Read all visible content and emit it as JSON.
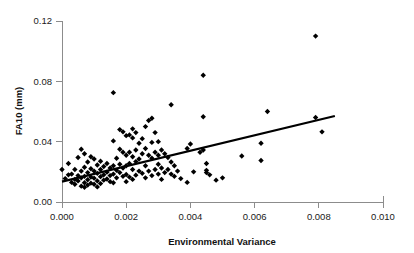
{
  "chart_data": {
    "type": "scatter",
    "title": "",
    "xlabel": "Environmental Variance",
    "ylabel": "FA10 (mm)",
    "xlim": [
      0.0,
      0.01
    ],
    "ylim": [
      0.0,
      0.12
    ],
    "xticks": [
      0.0,
      0.002,
      0.004,
      0.006,
      0.008,
      0.01
    ],
    "xtick_labels": [
      "0.000",
      "0.002",
      "0.004",
      "0.006",
      "0.008",
      "0.010"
    ],
    "yticks": [
      0.0,
      0.04,
      0.08,
      0.12
    ],
    "ytick_labels": [
      "0.00",
      "0.04",
      "0.08",
      "0.12"
    ],
    "grid": false,
    "legend": null,
    "marker": "diamond",
    "marker_color": "#000000",
    "points": [
      [
        0.0,
        0.0215
      ],
      [
        0.0001,
        0.0155
      ],
      [
        0.0002,
        0.0255
      ],
      [
        0.0002,
        0.018
      ],
      [
        0.0003,
        0.013
      ],
      [
        0.0003,
        0.0185
      ],
      [
        0.0004,
        0.0215
      ],
      [
        0.0004,
        0.015
      ],
      [
        0.0004,
        0.0118
      ],
      [
        0.0005,
        0.0295
      ],
      [
        0.0005,
        0.0175
      ],
      [
        0.0005,
        0.014
      ],
      [
        0.0006,
        0.035
      ],
      [
        0.0006,
        0.0205
      ],
      [
        0.0006,
        0.016
      ],
      [
        0.0006,
        0.0105
      ],
      [
        0.0007,
        0.032
      ],
      [
        0.0007,
        0.023
      ],
      [
        0.0007,
        0.017
      ],
      [
        0.0007,
        0.0128
      ],
      [
        0.0007,
        0.0098
      ],
      [
        0.0008,
        0.0265
      ],
      [
        0.0008,
        0.0195
      ],
      [
        0.0008,
        0.0148
      ],
      [
        0.0008,
        0.0112
      ],
      [
        0.0009,
        0.03
      ],
      [
        0.0009,
        0.022
      ],
      [
        0.0009,
        0.0165
      ],
      [
        0.0009,
        0.0125
      ],
      [
        0.001,
        0.0285
      ],
      [
        0.001,
        0.0205
      ],
      [
        0.001,
        0.0158
      ],
      [
        0.001,
        0.0118
      ],
      [
        0.0011,
        0.0245
      ],
      [
        0.0011,
        0.019
      ],
      [
        0.0011,
        0.014
      ],
      [
        0.0011,
        0.01
      ],
      [
        0.0012,
        0.027
      ],
      [
        0.0012,
        0.0215
      ],
      [
        0.0012,
        0.0168
      ],
      [
        0.0012,
        0.0122
      ],
      [
        0.0013,
        0.0235
      ],
      [
        0.0013,
        0.018
      ],
      [
        0.0013,
        0.0145
      ],
      [
        0.0014,
        0.0255
      ],
      [
        0.0014,
        0.0198
      ],
      [
        0.0014,
        0.0152
      ],
      [
        0.0015,
        0.0225
      ],
      [
        0.0015,
        0.0175
      ],
      [
        0.0015,
        0.0135
      ],
      [
        0.0016,
        0.0725
      ],
      [
        0.0016,
        0.0405
      ],
      [
        0.0016,
        0.024
      ],
      [
        0.0016,
        0.0185
      ],
      [
        0.0016,
        0.0128
      ],
      [
        0.0017,
        0.029
      ],
      [
        0.0017,
        0.021
      ],
      [
        0.0017,
        0.016
      ],
      [
        0.0018,
        0.048
      ],
      [
        0.0018,
        0.035
      ],
      [
        0.0018,
        0.025
      ],
      [
        0.0018,
        0.0195
      ],
      [
        0.0019,
        0.0465
      ],
      [
        0.0019,
        0.033
      ],
      [
        0.0019,
        0.0225
      ],
      [
        0.0019,
        0.017
      ],
      [
        0.002,
        0.044
      ],
      [
        0.002,
        0.031
      ],
      [
        0.002,
        0.024
      ],
      [
        0.002,
        0.0182
      ],
      [
        0.002,
        0.0135
      ],
      [
        0.0021,
        0.0445
      ],
      [
        0.0021,
        0.033
      ],
      [
        0.0021,
        0.0255
      ],
      [
        0.0021,
        0.0165
      ],
      [
        0.0022,
        0.0485
      ],
      [
        0.0022,
        0.0425
      ],
      [
        0.0022,
        0.03
      ],
      [
        0.0022,
        0.0215
      ],
      [
        0.0022,
        0.015
      ],
      [
        0.0023,
        0.046
      ],
      [
        0.0023,
        0.0345
      ],
      [
        0.0023,
        0.0268
      ],
      [
        0.0023,
        0.0178
      ],
      [
        0.0024,
        0.039
      ],
      [
        0.0024,
        0.0285
      ],
      [
        0.0024,
        0.0205
      ],
      [
        0.0025,
        0.042
      ],
      [
        0.0025,
        0.032
      ],
      [
        0.0025,
        0.019
      ],
      [
        0.0026,
        0.05
      ],
      [
        0.0026,
        0.0355
      ],
      [
        0.0026,
        0.024
      ],
      [
        0.0026,
        0.016
      ],
      [
        0.0027,
        0.054
      ],
      [
        0.0027,
        0.031
      ],
      [
        0.0027,
        0.0205
      ],
      [
        0.0028,
        0.0555
      ],
      [
        0.0028,
        0.0395
      ],
      [
        0.0028,
        0.029
      ],
      [
        0.0028,
        0.0175
      ],
      [
        0.0029,
        0.046
      ],
      [
        0.0029,
        0.033
      ],
      [
        0.0029,
        0.0215
      ],
      [
        0.003,
        0.04
      ],
      [
        0.003,
        0.031
      ],
      [
        0.003,
        0.025
      ],
      [
        0.003,
        0.0185
      ],
      [
        0.0031,
        0.0345
      ],
      [
        0.0031,
        0.0225
      ],
      [
        0.0031,
        0.015
      ],
      [
        0.0032,
        0.032
      ],
      [
        0.0032,
        0.0195
      ],
      [
        0.0033,
        0.0295
      ],
      [
        0.0033,
        0.0215
      ],
      [
        0.0034,
        0.0645
      ],
      [
        0.0034,
        0.0265
      ],
      [
        0.0034,
        0.0185
      ],
      [
        0.0035,
        0.024
      ],
      [
        0.0035,
        0.017
      ],
      [
        0.0036,
        0.0205
      ],
      [
        0.0037,
        0.0155
      ],
      [
        0.0039,
        0.0355
      ],
      [
        0.0039,
        0.013
      ],
      [
        0.004,
        0.0385
      ],
      [
        0.0041,
        0.02
      ],
      [
        0.0043,
        0.033
      ],
      [
        0.0044,
        0.084
      ],
      [
        0.0044,
        0.0565
      ],
      [
        0.0044,
        0.0345
      ],
      [
        0.0045,
        0.0255
      ],
      [
        0.0045,
        0.021
      ],
      [
        0.0045,
        0.0195
      ],
      [
        0.0046,
        0.018
      ],
      [
        0.0048,
        0.0145
      ],
      [
        0.005,
        0.016
      ],
      [
        0.0056,
        0.0305
      ],
      [
        0.0062,
        0.039
      ],
      [
        0.0062,
        0.0275
      ],
      [
        0.0064,
        0.06
      ],
      [
        0.0079,
        0.11
      ],
      [
        0.0079,
        0.056
      ],
      [
        0.0081,
        0.0465
      ]
    ],
    "trendline": {
      "x_start": 0.0,
      "y_start": 0.0135,
      "x_end": 0.0085,
      "y_end": 0.057,
      "color": "#000000"
    }
  }
}
